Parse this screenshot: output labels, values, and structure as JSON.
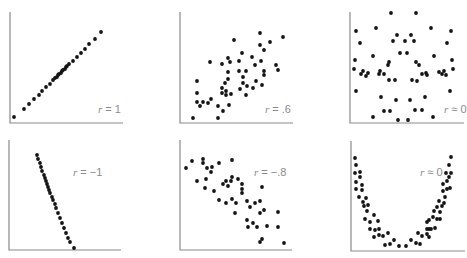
{
  "chart_data": [
    {
      "type": "scatter",
      "title": "",
      "annotation": "r = 1",
      "r": 1,
      "frame": {
        "x0": 10,
        "y0": 12,
        "x1": 123,
        "y1": 123
      },
      "label_pos": {
        "x": 98,
        "y": 109
      },
      "points": [
        [
          14,
          117
        ],
        [
          24,
          109
        ],
        [
          29,
          104
        ],
        [
          34,
          99
        ],
        [
          39,
          95
        ],
        [
          42,
          91
        ],
        [
          46,
          87
        ],
        [
          50,
          84
        ],
        [
          53,
          80
        ],
        [
          55,
          78
        ],
        [
          57,
          77
        ],
        [
          58,
          75
        ],
        [
          59,
          74
        ],
        [
          61,
          73
        ],
        [
          62,
          71
        ],
        [
          63,
          70
        ],
        [
          65,
          69
        ],
        [
          66,
          67
        ],
        [
          67,
          66
        ],
        [
          69,
          64
        ],
        [
          73,
          61
        ],
        [
          77,
          57
        ],
        [
          81,
          53
        ],
        [
          85,
          49
        ],
        [
          89,
          44
        ],
        [
          95,
          39
        ],
        [
          101,
          32
        ]
      ]
    },
    {
      "type": "scatter",
      "title": "",
      "annotation": "r = .6",
      "r": 0.6,
      "frame": {
        "x0": 180,
        "y0": 12,
        "x1": 293,
        "y1": 123
      },
      "label_pos": {
        "x": 266,
        "y": 109
      },
      "points": [
        [
          193,
          118
        ],
        [
          218,
          118
        ],
        [
          197,
          81
        ],
        [
          197,
          93
        ],
        [
          197,
          102
        ],
        [
          200,
          106
        ],
        [
          203,
          102
        ],
        [
          208,
          103
        ],
        [
          211,
          99
        ],
        [
          210,
          62
        ],
        [
          218,
          106
        ],
        [
          223,
          111
        ],
        [
          229,
          105
        ],
        [
          222,
          64
        ],
        [
          222,
          88
        ],
        [
          222,
          93
        ],
        [
          226,
          91
        ],
        [
          226,
          95
        ],
        [
          225,
          83
        ],
        [
          228,
          79
        ],
        [
          228,
          72
        ],
        [
          228,
          58
        ],
        [
          230,
          62
        ],
        [
          231,
          94
        ],
        [
          234,
          40
        ],
        [
          239,
          61
        ],
        [
          239,
          71
        ],
        [
          240,
          89
        ],
        [
          242,
          53
        ],
        [
          243,
          77
        ],
        [
          243,
          83
        ],
        [
          246,
          95
        ],
        [
          246,
          71
        ],
        [
          247,
          86
        ],
        [
          252,
          57
        ],
        [
          253,
          88
        ],
        [
          255,
          65
        ],
        [
          256,
          81
        ],
        [
          260,
          33
        ],
        [
          260,
          45
        ],
        [
          261,
          61
        ],
        [
          262,
          85
        ],
        [
          264,
          50
        ],
        [
          264,
          71
        ],
        [
          264,
          75
        ],
        [
          270,
          42
        ],
        [
          276,
          65
        ],
        [
          278,
          70
        ],
        [
          283,
          37
        ]
      ]
    },
    {
      "type": "scatter",
      "title": "",
      "annotation": "r ≈ 0",
      "r": 0,
      "frame": {
        "x0": 350,
        "y0": 12,
        "x1": 464,
        "y1": 123
      },
      "label_pos": {
        "x": 446,
        "y": 109
      },
      "points": [
        [
          356,
          31
        ],
        [
          360,
          43
        ],
        [
          376,
          28
        ],
        [
          391,
          13
        ],
        [
          416,
          13
        ],
        [
          431,
          28
        ],
        [
          451,
          31
        ],
        [
          447,
          43
        ],
        [
          355,
          60
        ],
        [
          354,
          69
        ],
        [
          361,
          74
        ],
        [
          363,
          71
        ],
        [
          366,
          76
        ],
        [
          368,
          73
        ],
        [
          373,
          56
        ],
        [
          379,
          74
        ],
        [
          380,
          71
        ],
        [
          384,
          74
        ],
        [
          388,
          65
        ],
        [
          389,
          62
        ],
        [
          389,
          80
        ],
        [
          395,
          80
        ],
        [
          393,
          41
        ],
        [
          397,
          35
        ],
        [
          405,
          41
        ],
        [
          411,
          35
        ],
        [
          414,
          41
        ],
        [
          400,
          53
        ],
        [
          407,
          53
        ],
        [
          416,
          62
        ],
        [
          419,
          65
        ],
        [
          412,
          80
        ],
        [
          417,
          81
        ],
        [
          422,
          74
        ],
        [
          426,
          73
        ],
        [
          427,
          75
        ],
        [
          434,
          56
        ],
        [
          439,
          72
        ],
        [
          442,
          74
        ],
        [
          444,
          71
        ],
        [
          446,
          75
        ],
        [
          452,
          60
        ],
        [
          453,
          69
        ],
        [
          356,
          91
        ],
        [
          450,
          91
        ],
        [
          381,
          97
        ],
        [
          396,
          100
        ],
        [
          410,
          100
        ],
        [
          425,
          97
        ],
        [
          384,
          111
        ],
        [
          390,
          111
        ],
        [
          415,
          110
        ],
        [
          422,
          110
        ],
        [
          373,
          117
        ],
        [
          398,
          120
        ],
        [
          408,
          120
        ],
        [
          433,
          117
        ]
      ]
    },
    {
      "type": "scatter",
      "title": "",
      "annotation": "r = −1",
      "r": -1,
      "frame": {
        "x0": 9,
        "y0": 140,
        "x1": 121,
        "y1": 250
      },
      "label_pos": {
        "x": 73,
        "y": 166
      },
      "points": [
        [
          37,
          155
        ],
        [
          38,
          159
        ],
        [
          40,
          163
        ],
        [
          41,
          167
        ],
        [
          42,
          171
        ],
        [
          44,
          175
        ],
        [
          45,
          178
        ],
        [
          46,
          181
        ],
        [
          47,
          184
        ],
        [
          48,
          187
        ],
        [
          49,
          190
        ],
        [
          50,
          193
        ],
        [
          52,
          197
        ],
        [
          53,
          200
        ],
        [
          55,
          204
        ],
        [
          56,
          208
        ],
        [
          58,
          213
        ],
        [
          60,
          218
        ],
        [
          62,
          223
        ],
        [
          64,
          228
        ],
        [
          66,
          233
        ],
        [
          68,
          238
        ],
        [
          70,
          242
        ],
        [
          74,
          248
        ]
      ]
    },
    {
      "type": "scatter",
      "title": "",
      "annotation": "r = −.8",
      "r": -0.8,
      "frame": {
        "x0": 180,
        "y0": 140,
        "x1": 292,
        "y1": 250
      },
      "label_pos": {
        "x": 254,
        "y": 166
      },
      "points": [
        [
          186,
          168
        ],
        [
          192,
          161
        ],
        [
          203,
          159
        ],
        [
          203,
          163
        ],
        [
          207,
          168
        ],
        [
          212,
          167
        ],
        [
          211,
          172
        ],
        [
          219,
          163
        ],
        [
          232,
          160
        ],
        [
          197,
          181
        ],
        [
          206,
          179
        ],
        [
          205,
          188
        ],
        [
          214,
          191
        ],
        [
          223,
          184
        ],
        [
          226,
          181
        ],
        [
          228,
          186
        ],
        [
          231,
          181
        ],
        [
          232,
          177
        ],
        [
          238,
          179
        ],
        [
          242,
          184
        ],
        [
          242,
          193
        ],
        [
          219,
          200
        ],
        [
          226,
          203
        ],
        [
          232,
          199
        ],
        [
          236,
          203
        ],
        [
          235,
          213
        ],
        [
          242,
          189
        ],
        [
          247,
          201
        ],
        [
          250,
          207
        ],
        [
          255,
          203
        ],
        [
          260,
          201
        ],
        [
          262,
          187
        ],
        [
          264,
          210
        ],
        [
          260,
          213
        ],
        [
          247,
          220
        ],
        [
          253,
          223
        ],
        [
          257,
          227
        ],
        [
          248,
          227
        ],
        [
          267,
          226
        ],
        [
          278,
          212
        ],
        [
          278,
          227
        ],
        [
          262,
          239
        ],
        [
          260,
          242
        ],
        [
          284,
          243
        ]
      ]
    },
    {
      "type": "scatter",
      "title": "",
      "annotation": "r ≈ 0",
      "r": 0,
      "frame": {
        "x0": 351,
        "y0": 141,
        "x1": 465,
        "y1": 251
      },
      "label_pos": {
        "x": 420,
        "y": 166
      },
      "points": [
        [
          355,
          158
        ],
        [
          356,
          165
        ],
        [
          355,
          173
        ],
        [
          360,
          172
        ],
        [
          360,
          177
        ],
        [
          356,
          182
        ],
        [
          362,
          185
        ],
        [
          356,
          189
        ],
        [
          362,
          190
        ],
        [
          359,
          197
        ],
        [
          366,
          198
        ],
        [
          363,
          202
        ],
        [
          364,
          206
        ],
        [
          368,
          205
        ],
        [
          367,
          211
        ],
        [
          374,
          215
        ],
        [
          365,
          219
        ],
        [
          370,
          222
        ],
        [
          378,
          221
        ],
        [
          370,
          229
        ],
        [
          375,
          230
        ],
        [
          379,
          229
        ],
        [
          374,
          237
        ],
        [
          379,
          235
        ],
        [
          383,
          236
        ],
        [
          388,
          233
        ],
        [
          385,
          245
        ],
        [
          390,
          244
        ],
        [
          394,
          240
        ],
        [
          399,
          246
        ],
        [
          406,
          246
        ],
        [
          411,
          240
        ],
        [
          416,
          243
        ],
        [
          418,
          233
        ],
        [
          420,
          244
        ],
        [
          422,
          236
        ],
        [
          427,
          234
        ],
        [
          429,
          229
        ],
        [
          429,
          237
        ],
        [
          427,
          229
        ],
        [
          431,
          229
        ],
        [
          435,
          228
        ],
        [
          427,
          222
        ],
        [
          429,
          220
        ],
        [
          433,
          217
        ],
        [
          437,
          219
        ],
        [
          440,
          219
        ],
        [
          434,
          211
        ],
        [
          437,
          207
        ],
        [
          440,
          212
        ],
        [
          442,
          206
        ],
        [
          439,
          201
        ],
        [
          444,
          203
        ],
        [
          445,
          197
        ],
        [
          443,
          191
        ],
        [
          447,
          189
        ],
        [
          443,
          184
        ],
        [
          450,
          188
        ],
        [
          447,
          181
        ],
        [
          449,
          177
        ],
        [
          446,
          173
        ],
        [
          451,
          173
        ],
        [
          449,
          165
        ],
        [
          451,
          157
        ]
      ]
    }
  ],
  "labels": {
    "p1": {
      "var": "r",
      "rest": " = 1"
    },
    "p2": {
      "var": "r",
      "rest": " = .6"
    },
    "p3": {
      "var": "r",
      "rest": " ≈ 0"
    },
    "p4": {
      "var": "r",
      "rest": " = −1"
    },
    "p5": {
      "var": "r",
      "rest": " = −.8"
    },
    "p6": {
      "var": "r",
      "rest": " ≈ 0"
    }
  }
}
